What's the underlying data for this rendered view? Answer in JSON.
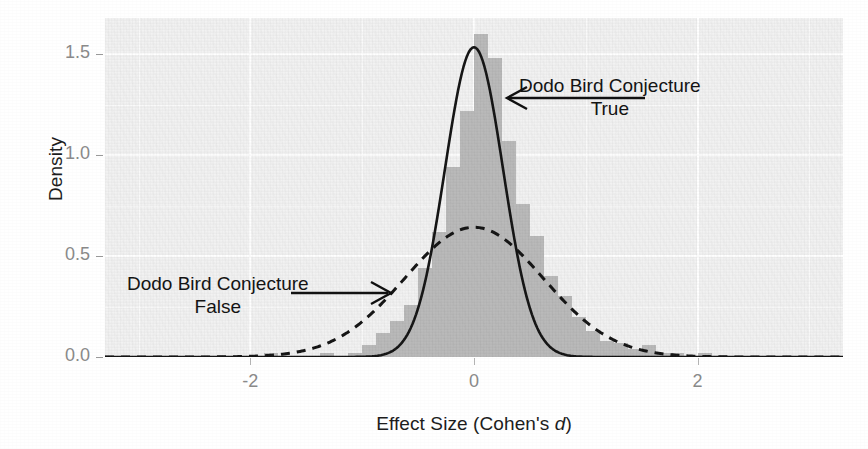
{
  "chart_data": {
    "type": "line",
    "title": "",
    "xlabel_plain": "Effect Size (Cohen's d)",
    "xlabel_prefix": "Effect Size (Cohen's ",
    "xlabel_italic": "d",
    "xlabel_suffix": ")",
    "ylabel": "Density",
    "xlim": [
      -3.3,
      3.3
    ],
    "ylim": [
      0.0,
      1.68
    ],
    "grid": true,
    "grid_color": "#ffffff",
    "panel_background": "#f2f2f2",
    "legend_position": "none",
    "x_ticks": [
      -2,
      0,
      2
    ],
    "x_tick_labels": [
      "-2",
      "0",
      "2"
    ],
    "y_ticks": [
      0.0,
      0.5,
      1.0,
      1.5
    ],
    "y_tick_labels": [
      "0.0",
      "0.5",
      "1.0",
      "1.5"
    ],
    "series": [
      {
        "name": "Dodo Bird Conjecture True",
        "style": "solid",
        "color": "#111111",
        "distribution": "normal",
        "mean": 0.0,
        "sd": 0.26,
        "peak_density": 1.535
      },
      {
        "name": "Dodo Bird Conjecture False",
        "style": "dashed",
        "color": "#111111",
        "distribution": "normal",
        "mean": 0.0,
        "sd": 0.62,
        "peak_density": 0.643
      },
      {
        "name": "Observed effect sizes",
        "style": "histogram",
        "color": "#b9b9b9",
        "bin_width": 0.125,
        "bin_centers": [
          -2.0625,
          -1.9375,
          -1.8125,
          -1.6875,
          -1.5625,
          -1.4375,
          -1.3125,
          -1.1875,
          -1.0625,
          -0.9375,
          -0.8125,
          -0.6875,
          -0.5625,
          -0.4375,
          -0.3125,
          -0.1875,
          -0.0625,
          0.0625,
          0.1875,
          0.3125,
          0.4375,
          0.5625,
          0.6875,
          0.8125,
          0.9375,
          1.0625,
          1.1875,
          1.3125,
          1.4375,
          1.5625,
          1.6875,
          1.8125,
          1.9375,
          2.0625,
          2.1875
        ],
        "bin_values": [
          0.0,
          0.0,
          0.02,
          0.0,
          0.0,
          0.0,
          0.02,
          0.0,
          0.02,
          0.06,
          0.12,
          0.18,
          0.26,
          0.44,
          0.62,
          0.94,
          1.22,
          1.6,
          1.48,
          1.07,
          0.76,
          0.6,
          0.4,
          0.3,
          0.2,
          0.13,
          0.08,
          0.07,
          0.04,
          0.06,
          0.02,
          0.02,
          0.0,
          0.02,
          0.0
        ]
      }
    ],
    "annotations": [
      {
        "id": "true-label",
        "line1": "Dodo Bird Conjecture",
        "line2": "True",
        "arrow": "left",
        "points_at": "solid-curve"
      },
      {
        "id": "false-label",
        "line1": "Dodo Bird Conjecture",
        "line2": "False",
        "arrow": "right",
        "points_at": "dashed-curve"
      }
    ]
  },
  "axes": {
    "y_title": "Density",
    "x_title_prefix": "Effect Size (Cohen's ",
    "x_title_italic": "d",
    "x_title_suffix": ")",
    "y_tick_labels": [
      "1.5",
      "1.0",
      "0.5",
      "0.0"
    ],
    "x_tick_labels": [
      "-2",
      "0",
      "2"
    ]
  },
  "annotations": {
    "true": {
      "line1": "Dodo Bird Conjecture",
      "line2": "True"
    },
    "false": {
      "line1": "Dodo Bird Conjecture",
      "line2": "False"
    }
  }
}
